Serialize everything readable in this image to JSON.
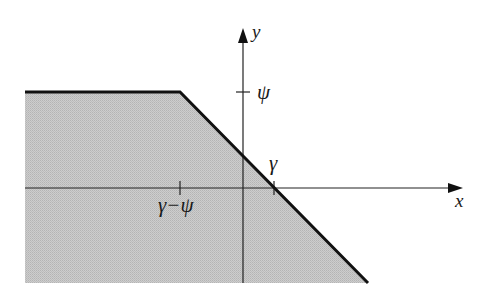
{
  "diagram": {
    "axes": {
      "x_label": "x",
      "y_label": "y"
    },
    "tick_labels": {
      "y_tick": "ψ",
      "x_intercept": "γ",
      "x_tick_left": "γ−ψ"
    },
    "region": {
      "description": "Shaded region below the boundary: horizontal line at y = ψ for x ≤ γ−ψ, then line of slope −1 passing through (γ, 0)",
      "fill_color": "#c6c6c6",
      "boundary_color": "#111111"
    }
  }
}
